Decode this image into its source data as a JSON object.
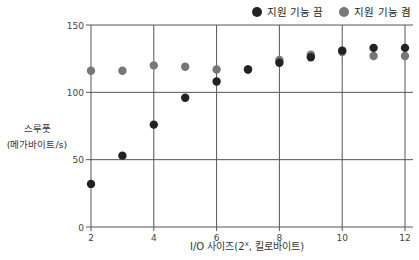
{
  "chart_data": {
    "type": "scatter",
    "title": "",
    "xlabel": "I/O 사이즈(2^x, 킬로바이트)",
    "xlabel_parts": {
      "pre": "I/O 사이즈(2",
      "sup": "x",
      "post": ", 킬로바이트)"
    },
    "ylabel": "스루풋 (메가바이트/s)",
    "ylabel_lines": [
      "스루풋",
      "(메가바이트/s)"
    ],
    "xlim": [
      2,
      12
    ],
    "ylim": [
      0,
      150
    ],
    "xticks": [
      2,
      4,
      6,
      8,
      10,
      12
    ],
    "yticks": [
      0,
      50,
      100,
      150
    ],
    "grid": true,
    "legend_position": "top-right",
    "series": [
      {
        "name": "지원 기능 끔",
        "color": "#222222",
        "x": [
          2,
          3,
          4,
          5,
          6,
          7,
          8,
          9,
          10,
          11,
          12
        ],
        "values": [
          32,
          53,
          76,
          96,
          108,
          117,
          122,
          126,
          131,
          133,
          133
        ]
      },
      {
        "name": "지원 기능 켬",
        "color": "#777777",
        "x": [
          2,
          3,
          4,
          5,
          6,
          7,
          8,
          9,
          10,
          11,
          12
        ],
        "values": [
          116,
          116,
          120,
          119,
          117,
          117,
          124,
          128,
          130,
          127,
          127
        ]
      }
    ]
  }
}
